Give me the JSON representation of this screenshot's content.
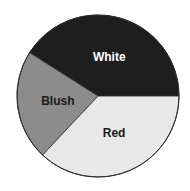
{
  "chart_data": {
    "type": "pie",
    "title": "",
    "categories": [
      "White",
      "Blush",
      "Red"
    ],
    "values": [
      41,
      22,
      37
    ],
    "units": "percent (estimated from slice angles)",
    "start_angle_deg": 0,
    "direction": "counterclockwise",
    "legend": "none (direct slice labels)",
    "slices": [
      {
        "label": "White",
        "value": 41,
        "color": "#1e1e1e",
        "label_color": "#ffffff"
      },
      {
        "label": "Blush",
        "value": 22,
        "color": "#8c8c8c",
        "label_color": "#1a1a1a"
      },
      {
        "label": "Red",
        "value": 37,
        "color": "#e8e8e8",
        "label_color": "#1a1a1a"
      }
    ],
    "geometry": {
      "cx": 98,
      "cy": 96,
      "r": 81
    },
    "outline_color": "#2a2a2a"
  }
}
